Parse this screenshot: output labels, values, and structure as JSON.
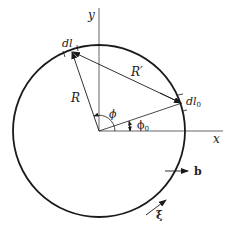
{
  "diagram": {
    "colors": {
      "stroke": "#1a1a1a",
      "axis": "#555555",
      "background": "#ffffff"
    },
    "axes": {
      "x_label": "x",
      "y_label": "y"
    },
    "labels": {
      "dl": "dl",
      "dl0_main": "dl",
      "dl0_sub": "0",
      "R": "R",
      "R_prime": "R′",
      "phi": "ϕ",
      "phi0_main": "ϕ",
      "phi0_sub": "0",
      "b": "b",
      "xi": "ξ"
    }
  }
}
